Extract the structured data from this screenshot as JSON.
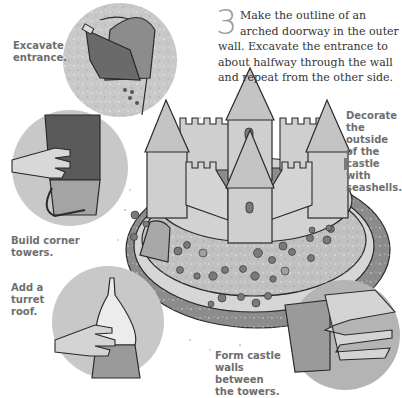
{
  "step": {
    "number": "3",
    "text": "Make the outline of an arched doorway in the outer wall. Excavate the entrance to about halfway through the wall and repeat from the other side."
  },
  "captions": {
    "excavate": "Excavate entrance.",
    "decorate": "Decorate the outside of the castle with seashells.",
    "corner_towers": "Build corner towers.",
    "turret_roof": "Add a turret roof.",
    "form_walls": "Form castle walls between the towers."
  },
  "colors": {
    "circle_bg": "#c8c8c8",
    "sand_light": "#d8d8d8",
    "sand_mid": "#b4b4b4",
    "sand_dark": "#8c8c8c",
    "outline": "#2a2a2a",
    "caption_text": "#6e6e6e"
  }
}
